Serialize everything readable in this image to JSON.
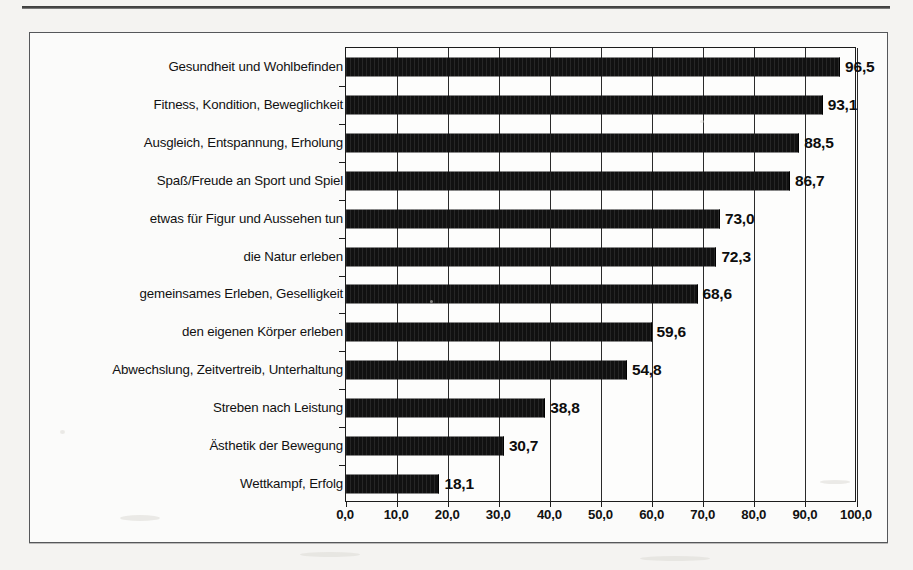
{
  "chart_data": {
    "type": "bar",
    "orientation": "horizontal",
    "title": "",
    "subtitle": "",
    "xlabel": "",
    "ylabel": "",
    "xlim": [
      0,
      100
    ],
    "xtick_labels": [
      "0,0",
      "10,0",
      "20,0",
      "30,0",
      "40,0",
      "50,0",
      "60,0",
      "70,0",
      "80,0",
      "90,0",
      "100,0"
    ],
    "xticks": [
      0,
      10,
      20,
      30,
      40,
      50,
      60,
      70,
      80,
      90,
      100
    ],
    "grid": "vertical",
    "legend": "none",
    "decimal_separator": ",",
    "bar_color": "#111111",
    "categories": [
      "Gesundheit und Wohlbefinden",
      "Fitness, Kondition, Beweglichkeit",
      "Ausgleich, Entspannung, Erholung",
      "Spaß/Freude an Sport und Spiel",
      "etwas für Figur und Aussehen tun",
      "die Natur erleben",
      "gemeinsames Erleben, Geselligkeit",
      "den eigenen Körper erleben",
      "Abwechslung, Zeitvertreib, Unterhaltung",
      "Streben nach Leistung",
      "Ästhetik der Bewegung",
      "Wettkampf, Erfolg"
    ],
    "values": [
      96.5,
      93.1,
      88.5,
      86.7,
      73.0,
      72.3,
      68.6,
      59.6,
      54.8,
      38.8,
      30.7,
      18.1
    ],
    "value_labels": [
      "96,5",
      "93,1",
      "88,5",
      "86,7",
      "73,0",
      "72,3",
      "68,6",
      "59,6",
      "54,8",
      "38,8",
      "30,7",
      "18,1"
    ]
  }
}
